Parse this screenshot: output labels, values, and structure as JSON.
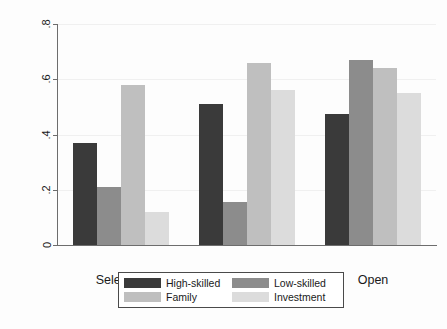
{
  "chart_data": {
    "type": "bar",
    "title": "",
    "subtitle": "",
    "xlabel": "",
    "ylabel": "Average Index Score",
    "categories": [
      "Selective",
      "Moderate",
      "Open"
    ],
    "ylim": [
      0,
      0.8
    ],
    "ytick_labels": [
      "0",
      ".2",
      ".4",
      ".6",
      ".8"
    ],
    "ytick_values": [
      0,
      0.2,
      0.4,
      0.6,
      0.8
    ],
    "grid": true,
    "grid_axis": "y",
    "legend_position": "bottom",
    "series": [
      {
        "name": "High-skilled",
        "color": "#3a3a3a",
        "values": [
          0.37,
          0.51,
          0.475
        ]
      },
      {
        "name": "Low-skilled",
        "color": "#8c8c8c",
        "values": [
          0.21,
          0.155,
          0.67
        ]
      },
      {
        "name": "Family",
        "color": "#bfbfbf",
        "values": [
          0.58,
          0.66,
          0.64
        ]
      },
      {
        "name": "Investment",
        "color": "#dcdcdc",
        "values": [
          0.12,
          0.56,
          0.55
        ]
      }
    ]
  },
  "legend": {
    "entries": [
      {
        "label": "High-skilled",
        "color": "#3a3a3a"
      },
      {
        "label": "Low-skilled",
        "color": "#8c8c8c"
      },
      {
        "label": "Family",
        "color": "#bfbfbf"
      },
      {
        "label": "Investment",
        "color": "#dcdcdc"
      }
    ]
  },
  "axis": {
    "y_title": "Average Index Score",
    "axis_line_color": "#6d6d6d",
    "grid_color": "#f0f0f0"
  }
}
